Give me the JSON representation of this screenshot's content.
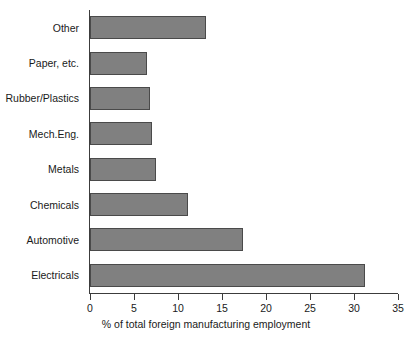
{
  "chart_data": {
    "type": "bar",
    "orientation": "horizontal",
    "title": "",
    "subtitle": "",
    "xlabel": "% of total foreign manufacturing employment",
    "ylabel": "",
    "categories": [
      "Other",
      "Paper, etc.",
      "Rubber/Plastics",
      "Mech.Eng.",
      "Metals",
      "Chemicals",
      "Automotive",
      "Electricals"
    ],
    "values": [
      13.2,
      6.5,
      6.8,
      7.1,
      7.5,
      11.1,
      17.4,
      31.2
    ],
    "xlim": [
      0,
      35
    ],
    "xticks": [
      0,
      5,
      10,
      15,
      20,
      25,
      30,
      35
    ],
    "xtick_labels": [
      "0",
      "5",
      "10",
      "15",
      "20",
      "25",
      "30",
      "35"
    ],
    "grid": false,
    "legend": null,
    "bar_fill_color": "#808080",
    "bar_edge_color": "#4a4a4a",
    "axis_color": "#3c3c3c",
    "background_color": "#ffffff",
    "annotations": []
  }
}
